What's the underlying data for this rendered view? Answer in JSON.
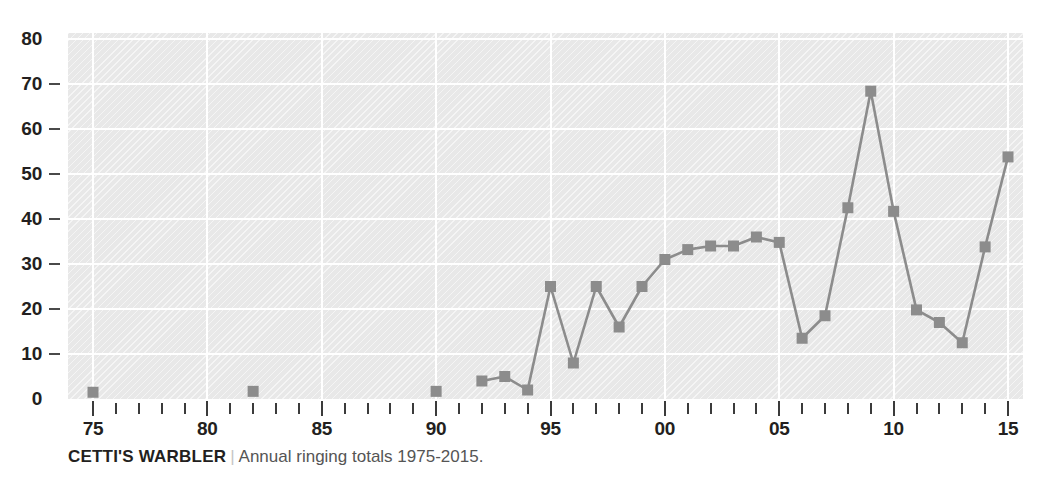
{
  "chart_data": {
    "type": "line",
    "title": "CETTI'S WARBLER",
    "subtitle": "Annual ringing totals 1975-2015.",
    "xlabel": "",
    "ylabel": "",
    "xlim": [
      1974,
      2016
    ],
    "ylim": [
      0,
      80
    ],
    "grid": true,
    "legend": null,
    "marker": "square",
    "series_color": "#8c8c8c",
    "x": [
      1975,
      1982,
      1990,
      1992,
      1993,
      1994,
      1995,
      1996,
      1997,
      1998,
      1999,
      2000,
      2001,
      2002,
      2003,
      2004,
      2005,
      2006,
      2007,
      2008,
      2009,
      2010,
      2011,
      2012,
      2013,
      2014,
      2015
    ],
    "values": [
      1.5,
      1.7,
      1.7,
      4.0,
      5.0,
      2.0,
      25.0,
      8.0,
      25.0,
      16.0,
      25.0,
      31.0,
      33.2,
      34.0,
      34.0,
      36.0,
      34.8,
      13.5,
      18.5,
      42.5,
      68.4,
      41.7,
      19.8,
      17.0,
      12.5,
      33.8,
      53.8
    ],
    "segments": [
      [
        1975
      ],
      [
        1982
      ],
      [
        1990
      ],
      [
        1992,
        1993,
        1994,
        1995,
        1996,
        1997,
        1998,
        1999,
        2000,
        2001,
        2002,
        2003,
        2004,
        2005,
        2006,
        2007,
        2008,
        2009,
        2010,
        2011,
        2012,
        2013,
        2014,
        2015
      ]
    ],
    "y_ticks": [
      0,
      10,
      20,
      30,
      40,
      50,
      60,
      70,
      80
    ],
    "y_tick_labels": [
      "0",
      "10",
      "20",
      "30",
      "40",
      "50",
      "60",
      "70",
      "80"
    ],
    "x_major_ticks": [
      1975,
      1980,
      1985,
      1990,
      1995,
      2000,
      2005,
      2010,
      2015
    ],
    "x_major_labels": [
      "75",
      "80",
      "85",
      "90",
      "95",
      "00",
      "05",
      "10",
      "15"
    ],
    "x_minor_step": 1
  },
  "caption": {
    "title": "CETTI'S WARBLER",
    "separator": "|",
    "subtitle": "Annual ringing totals 1975-2015."
  },
  "colors": {
    "plot_background": "#e8e8e8",
    "gridline": "#ffffff",
    "series": "#8c8c8c",
    "axis_text": "#231f20",
    "caption_subtitle": "#555555"
  }
}
